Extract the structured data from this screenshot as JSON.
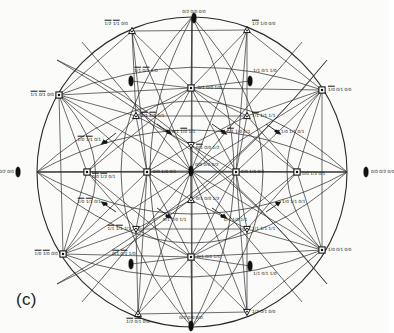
{
  "figure": {
    "caption": "(c)",
    "type": "stereographic-projection",
    "top_faint_text": "",
    "background_hex": "#fbfbfa",
    "line_hex": "#2a2a2a",
    "text_hex": "#151515"
  },
  "chart_data": {
    "type": "scatter",
    "title": "",
    "subtitle": "",
    "xlabel": "",
    "ylabel": "",
    "grid": false,
    "legend": "none",
    "projection": "stereographic pole figure with great-circle arcs",
    "xlim": [
      -1,
      1
    ],
    "ylim": [
      -1,
      1
    ],
    "marker_kinds": [
      "square-dot",
      "triangle-up",
      "triangle-down",
      "lens"
    ],
    "nodes": [
      {
        "id": "n01",
        "label": "0/2 0/0 0/0",
        "bars": [],
        "x": 194,
        "y": 18,
        "marker": "lens",
        "anchor": "center",
        "lx": 194,
        "ly": 12
      },
      {
        "id": "n02",
        "label": "1/2 1/1 0/0",
        "bars": [
          0,
          1
        ],
        "x": 132,
        "y": 31,
        "marker": "triangle-up",
        "anchor": "right",
        "lx": 128,
        "ly": 24
      },
      {
        "id": "n03",
        "label": "1/2 1/0 0/0",
        "bars": [
          0
        ],
        "x": 247,
        "y": 30,
        "marker": "triangle-up",
        "anchor": "left",
        "lx": 252,
        "ly": 24
      },
      {
        "id": "n04",
        "label": "1/1 0/1 1/0",
        "bars": [
          0,
          1
        ],
        "x": 131,
        "y": 81,
        "marker": "lens",
        "anchor": "center",
        "lx": 146,
        "ly": 71
      },
      {
        "id": "n05",
        "label": "1/1 0/1 1/0",
        "bars": [],
        "x": 250,
        "y": 81,
        "marker": "lens",
        "anchor": "center",
        "lx": 265,
        "ly": 71
      },
      {
        "id": "n06",
        "label": "1/1 0/1 0/0",
        "bars": [
          0,
          1
        ],
        "x": 59,
        "y": 95,
        "marker": "square-dot",
        "anchor": "right",
        "lx": 54,
        "ly": 95
      },
      {
        "id": "n07",
        "label": "0/1 0/0 1/0",
        "bars": [],
        "x": 191,
        "y": 88,
        "marker": "square-dot",
        "anchor": "left",
        "lx": 198,
        "ly": 88
      },
      {
        "id": "n08",
        "label": "1/0 0/1 0/0",
        "bars": [
          0
        ],
        "x": 322,
        "y": 90,
        "marker": "square-dot",
        "anchor": "left",
        "lx": 328,
        "ly": 90
      },
      {
        "id": "n09",
        "label": "1/1 1/1 1/1",
        "bars": [
          0,
          1
        ],
        "x": 136,
        "y": 116,
        "marker": "triangle-up",
        "anchor": "left",
        "lx": 141,
        "ly": 116
      },
      {
        "id": "n10",
        "label": "1/1 1/1 1/1",
        "bars": [
          0
        ],
        "x": 247,
        "y": 116,
        "marker": "triangle-up",
        "anchor": "left",
        "lx": 252,
        "ly": 116
      },
      {
        "id": "n11",
        "label": "0/1 1/0 1/1",
        "bars": [
          1
        ],
        "x": 167,
        "y": 131,
        "marker": "arrow",
        "anchor": "left",
        "lx": 172,
        "ly": 132
      },
      {
        "id": "n12",
        "label": "0/1 1/0 1/1",
        "bars": [
          0
        ],
        "x": 222,
        "y": 131,
        "marker": "arrow",
        "anchor": "left",
        "lx": 227,
        "ly": 132
      },
      {
        "id": "n13",
        "label": "1/0 1/1 0/1",
        "bars": [],
        "x": 276,
        "y": 131,
        "marker": "arrow",
        "anchor": "left",
        "lx": 281,
        "ly": 132
      },
      {
        "id": "n14",
        "label": "1/0 1/1 0/1",
        "bars": [
          0,
          1
        ],
        "x": 106,
        "y": 142,
        "marker": "arrow",
        "anchor": "right",
        "lx": 101,
        "ly": 140
      },
      {
        "id": "n15",
        "label": "0/1 0/0 1/2",
        "bars": [
          0
        ],
        "x": 191,
        "y": 145,
        "marker": "triangle-down",
        "anchor": "left",
        "lx": 196,
        "ly": 148
      },
      {
        "id": "n16",
        "label": "0/0 0/0 0/2",
        "bars": [],
        "x": 191,
        "y": 171,
        "marker": "lens",
        "anchor": "center",
        "lx": 207,
        "ly": 165
      },
      {
        "id": "n17",
        "label": "0/0 0/2 0/0",
        "bars": [],
        "x": 18,
        "y": 172,
        "marker": "lens",
        "anchor": "right",
        "lx": 14,
        "ly": 172
      },
      {
        "id": "n18",
        "label": "0/0 1/2 0/1",
        "bars": [
          0,
          1
        ],
        "x": 87,
        "y": 172,
        "marker": "square-dot",
        "anchor": "left",
        "lx": 92,
        "ly": 177
      },
      {
        "id": "n19",
        "label": "0/0 1/0 0/1",
        "bars": [],
        "x": 147,
        "y": 172,
        "marker": "square-dot",
        "anchor": "left",
        "lx": 153,
        "ly": 172
      },
      {
        "id": "n20",
        "label": "0/0 1/0 0/1",
        "bars": [],
        "x": 236,
        "y": 172,
        "marker": "square-dot",
        "anchor": "left",
        "lx": 241,
        "ly": 172
      },
      {
        "id": "n21",
        "label": "0/0 1/2 0/1",
        "bars": [],
        "x": 297,
        "y": 172,
        "marker": "square-dot",
        "anchor": "left",
        "lx": 302,
        "ly": 174
      },
      {
        "id": "n22",
        "label": "0/0 0/2 0/0",
        "bars": [],
        "x": 366,
        "y": 172,
        "marker": "lens",
        "anchor": "left",
        "lx": 371,
        "ly": 172
      },
      {
        "id": "n23",
        "label": "0/1 0/0 1/2",
        "bars": [],
        "x": 191,
        "y": 200,
        "marker": "triangle-up",
        "anchor": "left",
        "lx": 196,
        "ly": 199
      },
      {
        "id": "n24",
        "label": "1/0 1/1 0/1",
        "bars": [
          0,
          1
        ],
        "x": 106,
        "y": 204,
        "marker": "arrow",
        "anchor": "right",
        "lx": 101,
        "ly": 202
      },
      {
        "id": "n25",
        "label": "1/0 1/1 0/1",
        "bars": [],
        "x": 277,
        "y": 203,
        "marker": "arrow",
        "anchor": "left",
        "lx": 282,
        "ly": 202
      },
      {
        "id": "n26",
        "label": "0/1 1/0 1/1",
        "bars": [],
        "x": 167,
        "y": 216,
        "marker": "arrow",
        "anchor": "left",
        "lx": 163,
        "ly": 220
      },
      {
        "id": "n27",
        "label": "0/1 1/0 1/1",
        "bars": [],
        "x": 222,
        "y": 216,
        "marker": "arrow",
        "anchor": "left",
        "lx": 224,
        "ly": 220
      },
      {
        "id": "n28",
        "label": "1/1 1/1 1/1",
        "bars": [
          0,
          1
        ],
        "x": 136,
        "y": 229,
        "marker": "triangle-down",
        "anchor": "right",
        "lx": 131,
        "ly": 229
      },
      {
        "id": "n29",
        "label": "1/1 1/1 1/1",
        "bars": [],
        "x": 247,
        "y": 229,
        "marker": "triangle-down",
        "anchor": "left",
        "lx": 252,
        "ly": 229
      },
      {
        "id": "n30",
        "label": "1/0 1/0 0/0",
        "bars": [
          0,
          1
        ],
        "x": 63,
        "y": 254,
        "marker": "square-dot",
        "anchor": "right",
        "lx": 58,
        "ly": 254
      },
      {
        "id": "n31",
        "label": "0/1 0/0 1/0",
        "bars": [],
        "x": 191,
        "y": 257,
        "marker": "square-dot",
        "anchor": "left",
        "lx": 197,
        "ly": 257
      },
      {
        "id": "n32",
        "label": "1/0 0/1 0/0",
        "bars": [],
        "x": 322,
        "y": 250,
        "marker": "square-dot",
        "anchor": "left",
        "lx": 328,
        "ly": 250
      },
      {
        "id": "n33",
        "label": "0/1 0/1 1/0",
        "bars": [
          0,
          1
        ],
        "x": 131,
        "y": 264,
        "marker": "lens",
        "anchor": "center",
        "lx": 124,
        "ly": 254
      },
      {
        "id": "n34",
        "label": "1/1 0/1 1/0",
        "bars": [],
        "x": 250,
        "y": 266,
        "marker": "lens",
        "anchor": "center",
        "lx": 265,
        "ly": 274
      },
      {
        "id": "n35",
        "label": "1/2 0/1 0/0",
        "bars": [
          0,
          1
        ],
        "x": 138,
        "y": 314,
        "marker": "triangle-up",
        "anchor": "center",
        "lx": 138,
        "ly": 322
      },
      {
        "id": "n36",
        "label": "1/2 0/1 0/0",
        "bars": [],
        "x": 247,
        "y": 312,
        "marker": "triangle-down",
        "anchor": "left",
        "lx": 252,
        "ly": 312
      },
      {
        "id": "n37",
        "label": "0/2 0/0 0/0",
        "bars": [],
        "x": 191,
        "y": 326,
        "marker": "lens",
        "anchor": "center",
        "lx": 191,
        "ly": 318
      }
    ],
    "edge_count": 96,
    "outer_circle": {
      "cx": 192,
      "cy": 172,
      "r": 155
    }
  }
}
